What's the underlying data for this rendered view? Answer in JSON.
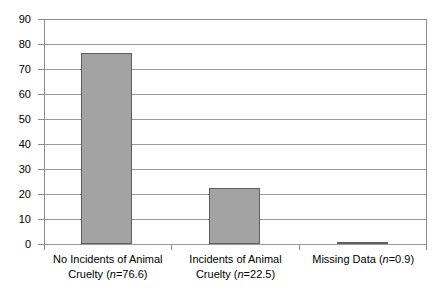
{
  "chart_data": {
    "type": "bar",
    "title": "",
    "subtitle": "",
    "xlabel": "",
    "ylabel": "",
    "categories": [
      "No Incidents of Animal Cruelty (n=76.6)",
      "Incidents of Animal Cruelty (n=22.5)",
      "Missing Data (n=0.9)"
    ],
    "values": [
      76.6,
      22.5,
      0.9
    ],
    "ylim": [
      0,
      90
    ],
    "ytick_step": 10,
    "yticks": [
      90,
      80,
      70,
      60,
      50,
      40,
      30,
      20,
      10,
      0
    ],
    "grid": true,
    "legend": "none",
    "bar_fill_color": "#a3a3a3",
    "bar_border_color": "#5f5f5f",
    "gridline_color": "#9a9a9a",
    "plot_border_color": "#8c8c8c"
  },
  "axis": {
    "y_tick_labels": [
      "90",
      "80",
      "70",
      "60",
      "50",
      "40",
      "30",
      "20",
      "10",
      "0"
    ]
  },
  "x_labels": [
    {
      "line1": "No Incidents of Animal",
      "line2_prefix": "Cruelty (",
      "line2_italic": "n",
      "line2_suffix": "=76.6)"
    },
    {
      "line1": "Incidents of Animal",
      "line2_prefix": "Cruelty (",
      "line2_italic": "n",
      "line2_suffix": "=22.5)"
    },
    {
      "line1": "",
      "line2_prefix": "Missing Data (",
      "line2_italic": "n",
      "line2_suffix": "=0.9)"
    }
  ]
}
